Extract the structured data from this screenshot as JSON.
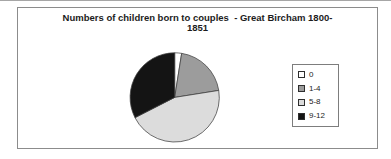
{
  "figure": {
    "background": "#ffffff",
    "top_rule_color": "#a6a6a6",
    "frame_border_color": "#8c8c8c"
  },
  "chart_data": {
    "type": "pie",
    "title_lines": [
      "Numbers of children born to couples  - Great Bircham 1800-",
      "1851"
    ],
    "categories": [
      "0",
      "1-4",
      "5-8",
      "9-12"
    ],
    "values_percent": [
      2.5,
      20,
      45,
      32.5
    ],
    "colors": [
      "#ffffff",
      "#9c9c9c",
      "#dcdcdc",
      "#141414"
    ],
    "slice_outline_color": "#404040",
    "start_angle_deg": 0,
    "direction": "clockwise",
    "legend_position": "right",
    "legend_border_color": "#7d7d7d"
  }
}
